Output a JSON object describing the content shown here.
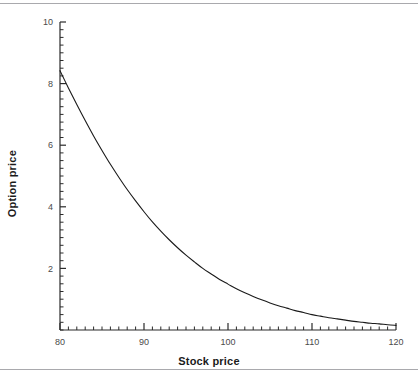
{
  "figure": {
    "x_axis_title": "Stock price",
    "y_axis_title": "Option price"
  },
  "chart_data": {
    "type": "line",
    "title": "",
    "xlabel": "Stock price",
    "ylabel": "Option price",
    "xlim": [
      80,
      120
    ],
    "ylim": [
      0,
      10
    ],
    "grid": false,
    "legend": "none",
    "x_ticks": [
      80,
      90,
      100,
      110,
      120
    ],
    "x_tick_labels": [
      "80",
      "90",
      "100",
      "110",
      "120"
    ],
    "x_minor_tick_step": 1,
    "y_ticks": [
      2,
      4,
      6,
      8,
      10
    ],
    "y_tick_labels": [
      "2",
      "4",
      "6",
      "8",
      "10"
    ],
    "y_minor_tick_step": 0.25,
    "line_color": "#1a1a1a",
    "line_width": 1.1,
    "series": [
      {
        "name": "Option price",
        "x": [
          80,
          81,
          82,
          83,
          84,
          85,
          86,
          87,
          88,
          89,
          90,
          91,
          92,
          93,
          94,
          95,
          96,
          97,
          98,
          99,
          100,
          101,
          102,
          103,
          104,
          105,
          106,
          107,
          108,
          109,
          110,
          111,
          112,
          113,
          114,
          115,
          116,
          117,
          118,
          119,
          120
        ],
        "y": [
          8.42,
          7.86,
          7.32,
          6.8,
          6.3,
          5.83,
          5.38,
          4.96,
          4.56,
          4.19,
          3.84,
          3.51,
          3.21,
          2.93,
          2.67,
          2.43,
          2.21,
          2.0,
          1.82,
          1.64,
          1.49,
          1.34,
          1.21,
          1.09,
          0.98,
          0.88,
          0.79,
          0.71,
          0.63,
          0.57,
          0.5,
          0.45,
          0.4,
          0.36,
          0.32,
          0.28,
          0.25,
          0.22,
          0.2,
          0.17,
          0.15
        ]
      }
    ]
  }
}
